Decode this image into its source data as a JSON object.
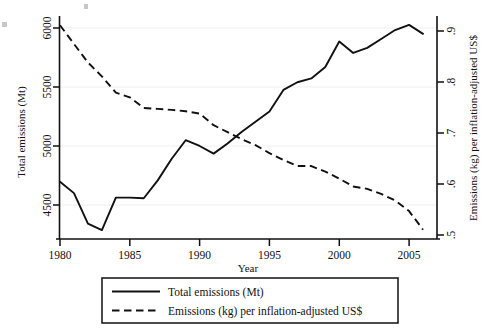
{
  "figure": {
    "background_color": "#ffffff",
    "line_color": "#111111"
  },
  "axes": {
    "x": {
      "label": "Year",
      "ticks": [
        "1980",
        "1985",
        "1990",
        "1995",
        "2000",
        "2005"
      ],
      "tick_values": [
        1980,
        1985,
        1990,
        1995,
        2000,
        2005
      ],
      "range": [
        1980,
        2007
      ]
    },
    "y_left": {
      "label": "Total emissions (Mt)",
      "ticks": [
        "4500",
        "5000",
        "5500",
        "6000"
      ],
      "tick_values": [
        4500,
        5000,
        5500,
        6000
      ],
      "range": [
        4330,
        6080
      ]
    },
    "y_right": {
      "label": "Emissions (kg) per inflation-adjusted US$",
      "ticks": [
        ".5",
        ".6",
        ".7",
        ".8",
        ".9"
      ],
      "tick_values": [
        0.5,
        0.6,
        0.7,
        0.8,
        0.9
      ],
      "range": [
        0.475,
        0.955
      ]
    }
  },
  "legend": {
    "position": "below-axes",
    "entries": [
      {
        "label": "Total emissions (Mt)",
        "style": "solid"
      },
      {
        "label": "Emissions (kg) per inflation-adjusted US$",
        "style": "dashed"
      }
    ]
  },
  "chart_data": {
    "type": "line",
    "title": "",
    "xlabel": "Year",
    "ylabel": "Total emissions (Mt)",
    "ylabel_right": "Emissions (kg) per inflation-adjusted US$",
    "xlim": [
      1980,
      2007
    ],
    "ylim": [
      4330,
      6080
    ],
    "ylim_right": [
      0.475,
      0.955
    ],
    "grid": false,
    "legend_position": "bottom",
    "x": [
      1980,
      1981,
      1982,
      1983,
      1984,
      1985,
      1986,
      1987,
      1988,
      1989,
      1990,
      1991,
      1992,
      1993,
      1994,
      1995,
      1996,
      1997,
      1998,
      1999,
      2000,
      2001,
      2002,
      2003,
      2004,
      2005,
      2006
    ],
    "series": [
      {
        "name": "Total emissions (Mt)",
        "style": "solid",
        "axis": "left",
        "units": "Mt",
        "values": [
          4780,
          4690,
          4450,
          4400,
          4655,
          4655,
          4650,
          4790,
          4960,
          5105,
          5060,
          5000,
          5080,
          5170,
          5250,
          5330,
          5500,
          5560,
          5590,
          5680,
          5880,
          5790,
          5830,
          5900,
          5970,
          6010,
          5940
        ]
      },
      {
        "name": "Emissions (kg) per inflation-adjusted US$",
        "style": "dashed",
        "axis": "right",
        "units": "kg per US$",
        "values": [
          0.935,
          0.895,
          0.855,
          0.825,
          0.79,
          0.78,
          0.757,
          0.755,
          0.753,
          0.75,
          0.745,
          0.72,
          0.705,
          0.69,
          0.677,
          0.66,
          0.645,
          0.632,
          0.632,
          0.62,
          0.605,
          0.588,
          0.583,
          0.572,
          0.558,
          0.535,
          0.495
        ]
      }
    ]
  }
}
